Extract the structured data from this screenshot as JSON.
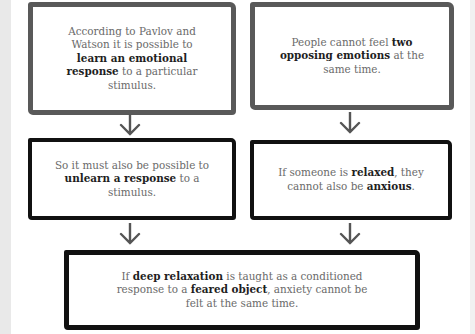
{
  "diagram": {
    "boxes": [
      {
        "id": "premise-1",
        "segments": [
          {
            "t": "According to Pavlov and Watson it is possible to ",
            "b": false
          },
          {
            "t": "learn an emotional response",
            "b": true
          },
          {
            "t": " to a particular stimulus.",
            "b": false
          }
        ]
      },
      {
        "id": "premise-2",
        "segments": [
          {
            "t": "People cannot feel ",
            "b": false
          },
          {
            "t": "two opposing emotions",
            "b": true
          },
          {
            "t": " at the same time.",
            "b": false
          }
        ]
      },
      {
        "id": "inference-1",
        "segments": [
          {
            "t": "So it must also be possible to ",
            "b": false
          },
          {
            "t": "unlearn a response",
            "b": true
          },
          {
            "t": " to a stimulus.",
            "b": false
          }
        ]
      },
      {
        "id": "inference-2",
        "segments": [
          {
            "t": "If someone is ",
            "b": false
          },
          {
            "t": "relaxed",
            "b": true
          },
          {
            "t": ", they cannot also be ",
            "b": false
          },
          {
            "t": "anxious",
            "b": true
          },
          {
            "t": ".",
            "b": false
          }
        ]
      },
      {
        "id": "conclusion",
        "segments": [
          {
            "t": "If ",
            "b": false
          },
          {
            "t": "deep relaxation",
            "b": true
          },
          {
            "t": " is taught as a conditioned response to a ",
            "b": false
          },
          {
            "t": "feared object",
            "b": true
          },
          {
            "t": ", anxiety cannot be felt at the same time.",
            "b": false
          }
        ]
      }
    ],
    "colors": {
      "gray_border": "#595959",
      "black_border": "#111111",
      "arrow": "#555555",
      "text": "#6a6a6a",
      "bold_text": "#1e1e1e"
    }
  }
}
